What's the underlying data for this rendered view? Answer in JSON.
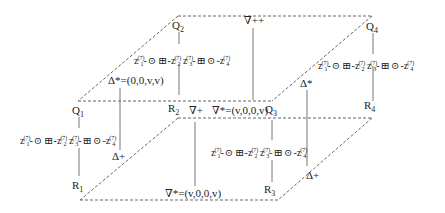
{
  "diagram": {
    "type": "cube-lattice",
    "nodes": {
      "Q1": {
        "label": "Q",
        "index": "1"
      },
      "Q2": {
        "label": "Q",
        "index": "2"
      },
      "Q3": {
        "label": "Q",
        "index": "3"
      },
      "Q4": {
        "label": "Q",
        "index": "4"
      },
      "R1": {
        "label": "R",
        "index": "1"
      },
      "R2": {
        "label": "R",
        "index": "2"
      },
      "R3": {
        "label": "R",
        "index": "3"
      },
      "R4": {
        "label": "R",
        "index": "4"
      }
    },
    "chain": {
      "var": "z",
      "superscript": "(7)",
      "i1": "1",
      "i2": "2",
      "i3": "3",
      "i4": "4",
      "odot": "⊙",
      "boxplus": "⊞",
      "dash": "-"
    },
    "edge_labels": {
      "delta_star_vec": "Δ*=(0,0,v,v)",
      "delta_star": "Δ*",
      "delta_plus_left": "Δ+",
      "delta_plus_right": "Δ+",
      "nabla_plusplus": "∇++",
      "nabla_plus": "∇+",
      "nabla_star_top": "∇*=(v,0,0,v)",
      "nabla_star_bottom": "∇*=(v,0,0,v)"
    },
    "colors": {
      "line": "#555555",
      "text": "#222222"
    }
  }
}
